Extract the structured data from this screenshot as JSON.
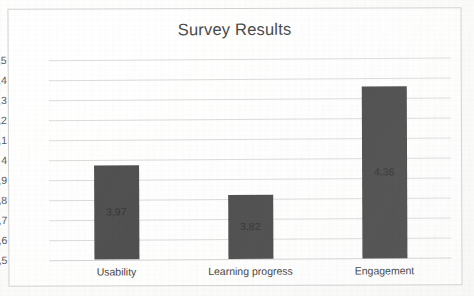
{
  "chart_data": {
    "type": "bar",
    "title": "Survey Results",
    "xlabel": "",
    "ylabel": "",
    "categories": [
      "Usability",
      "Learning progress",
      "Engagement"
    ],
    "values": [
      3.97,
      3.82,
      4.36
    ],
    "value_labels": [
      "3,97",
      "3,82",
      "4,36"
    ],
    "ylim": [
      3.5,
      4.5
    ],
    "ytick_labels": [
      "4,5",
      "4,4",
      "4,3",
      "4,2",
      "4,1",
      "4",
      "3,9",
      "3,8",
      "3,7",
      "3,6",
      "3,5"
    ],
    "ytick_values": [
      4.5,
      4.4,
      4.3,
      4.2,
      4.1,
      4.0,
      3.9,
      3.8,
      3.7,
      3.6,
      3.5
    ],
    "grid": true,
    "legend": null,
    "decimal_separator": ",",
    "series": [
      {
        "name": "Survey Results",
        "values": [
          3.97,
          3.82,
          4.36
        ],
        "color": "#4d4d4d"
      }
    ]
  },
  "style": {
    "bar_color": "#4d4d4d",
    "grid_color": "#dcdcdc",
    "frame_color": "#d2d2d2",
    "title_color": "#474747",
    "tick_color": "#535353",
    "value_label_color": "#1f1f1f",
    "background": "#fdfdfc"
  }
}
